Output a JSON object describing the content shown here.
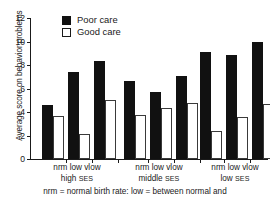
{
  "chart_data": {
    "type": "bar",
    "title": "",
    "xlabel": "",
    "ylabel": "Average score on behavior problems",
    "ylim": [
      0,
      12
    ],
    "yticks": [
      0,
      2,
      4,
      6,
      8,
      10,
      12
    ],
    "grid": false,
    "legend_position": "top-left-inside",
    "categories": [
      "nrm / high SES",
      "low / high SES",
      "vlow / high SES",
      "nrm / middle SES",
      "low / middle SES",
      "vlow / middle SES",
      "nrm / low SES",
      "low / low SES",
      "vlow / low SES"
    ],
    "series": [
      {
        "name": "Poor care",
        "color": "#111111",
        "values": [
          4.6,
          7.4,
          8.3,
          6.6,
          5.7,
          7.05,
          9.1,
          8.85,
          10.0
        ]
      },
      {
        "name": "Good care",
        "color": "#ffffff",
        "values": [
          3.7,
          2.1,
          5.05,
          3.75,
          4.3,
          4.75,
          2.4,
          3.55,
          4.65
        ]
      }
    ],
    "groups": [
      {
        "ses_label": "high",
        "ses_suffix": "SES",
        "birth_labels": "nrm low vlow",
        "bars": [
          {
            "birth": "nrm",
            "poor": 4.6,
            "good": 3.7
          },
          {
            "birth": "low",
            "poor": 7.4,
            "good": 2.1
          },
          {
            "birth": "vlow",
            "poor": 8.3,
            "good": 5.05
          }
        ]
      },
      {
        "ses_label": "middle",
        "ses_suffix": "SES",
        "birth_labels": "nrm low vlow",
        "bars": [
          {
            "birth": "nrm",
            "poor": 6.6,
            "good": 3.75
          },
          {
            "birth": "low",
            "poor": 5.7,
            "good": 4.3
          },
          {
            "birth": "vlow",
            "poor": 7.05,
            "good": 4.75
          }
        ]
      },
      {
        "ses_label": "low",
        "ses_suffix": "SES",
        "birth_labels": "nrm low vlow",
        "bars": [
          {
            "birth": "nrm",
            "poor": 9.1,
            "good": 2.4
          },
          {
            "birth": "low",
            "poor": 8.85,
            "good": 3.55
          },
          {
            "birth": "vlow",
            "poor": 10.0,
            "good": 4.65
          }
        ]
      }
    ]
  },
  "legend": {
    "items": [
      {
        "label": "Poor care",
        "swatch": "filled-black-square"
      },
      {
        "label": "Good care",
        "swatch": "open-white-square"
      }
    ]
  },
  "axis": {
    "y_title": "Average score on behavior problems",
    "y_tick_labels": [
      "0",
      "2",
      "4",
      "6",
      "8",
      "10",
      "12"
    ]
  },
  "caption": {
    "text": "nrm  = normal birth rate: low = between normal and"
  },
  "colors": {
    "poor_care": "#111111",
    "good_care": "#ffffff",
    "outline": "#3a3a3a",
    "axis": "#1a1a1a",
    "background": "#ffffff"
  }
}
